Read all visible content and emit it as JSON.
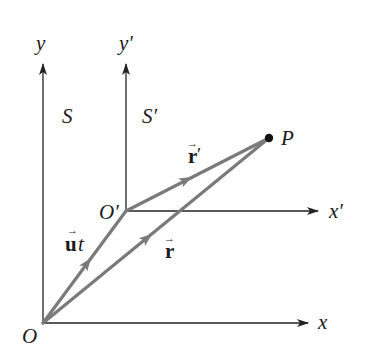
{
  "diagram": {
    "colors": {
      "axis": "#222222",
      "vector": "#7a7a7a",
      "text": "#1a1a1a",
      "background": "#ffffff"
    },
    "frames": [
      {
        "id": "S",
        "label": "S",
        "origin_label": "O",
        "x_axis_label": "x",
        "y_axis_label": "y"
      },
      {
        "id": "S_prime",
        "label": "S′",
        "origin_label": "O′",
        "x_axis_label": "x′",
        "y_axis_label": "y′"
      }
    ],
    "point": {
      "label": "P"
    },
    "vectors": [
      {
        "id": "ut",
        "label_bold": "u",
        "label_suffix": "t",
        "from": "O",
        "to": "O′"
      },
      {
        "id": "r",
        "label_bold": "r",
        "label_suffix": "",
        "from": "O",
        "to": "P"
      },
      {
        "id": "r_prime",
        "label_bold": "r",
        "label_suffix": "′",
        "from": "O′",
        "to": "P"
      }
    ],
    "labels": {
      "y": "y",
      "y_prime": "y′",
      "x": "x",
      "x_prime": "x′",
      "S": "S",
      "S_prime": "S′",
      "O": "O",
      "O_prime": "O′",
      "P": "P",
      "vec_arrow": "→",
      "ut_bold": "u",
      "ut_t": "t",
      "r_bold": "r",
      "rp_bold": "r",
      "rp_prime": "′"
    }
  }
}
